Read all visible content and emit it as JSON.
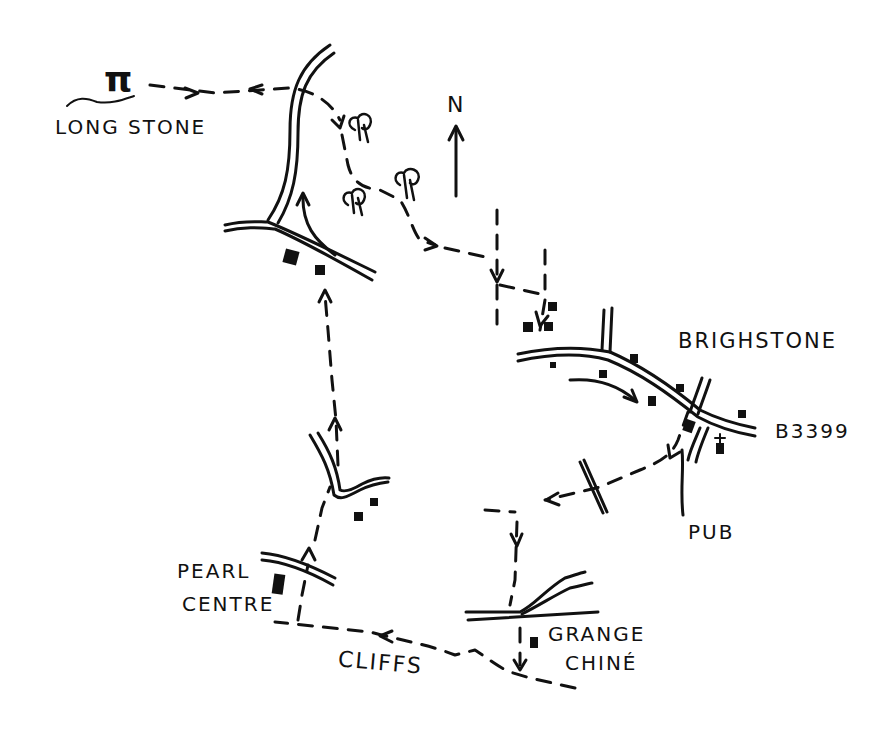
{
  "map": {
    "title": "Hand-drawn walking route map",
    "north_label": "N",
    "labels": {
      "long_stone": "LONG STONE",
      "brighstone": "BRIGHSTONE",
      "road_number": "B3399",
      "pub": "PUB",
      "pearl_centre_line1": "PEARL",
      "pearl_centre_line2": "CENTRE",
      "cliffs": "CLIFFS",
      "grange_chine_line1": "GRANGE",
      "grange_chine_line2": "CHINÉ"
    },
    "symbols": {
      "long_stone": "π",
      "church": "✝"
    },
    "colors": {
      "ink": "#111111",
      "paper": "#ffffff"
    }
  }
}
